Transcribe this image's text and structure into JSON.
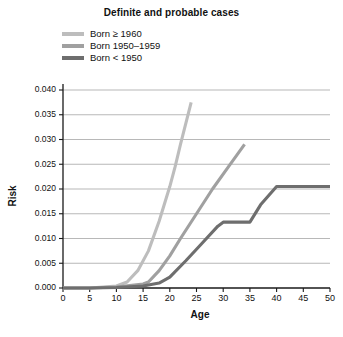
{
  "chart_data": {
    "type": "line",
    "title": "Definite and probable cases",
    "xlabel": "Age",
    "ylabel": "Risk",
    "xlim": [
      0,
      50
    ],
    "ylim": [
      0.0,
      0.04
    ],
    "xticks": [
      0,
      5,
      10,
      15,
      20,
      25,
      30,
      35,
      40,
      45,
      50
    ],
    "yticks": [
      0.0,
      0.005,
      0.01,
      0.015,
      0.02,
      0.025,
      0.03,
      0.035,
      0.04
    ],
    "ytick_labels": [
      "0.000",
      "0.005",
      "0.010",
      "0.015",
      "0.020",
      "0.025",
      "0.030",
      "0.035",
      "0.040"
    ],
    "xtick_labels": [
      "0",
      "5",
      "10",
      "15",
      "20",
      "25",
      "30",
      "35",
      "40",
      "45",
      "50"
    ],
    "grid": "horizontal",
    "legend_position": "above-plot-left",
    "series": [
      {
        "name": "Born ≥ 1960",
        "color": "#bdbdbd",
        "x": [
          0,
          5,
          10,
          12,
          14,
          16,
          18,
          20,
          21,
          22,
          24
        ],
        "y": [
          0.0,
          0.0,
          0.0004,
          0.0012,
          0.0035,
          0.0075,
          0.0135,
          0.0205,
          0.0245,
          0.029,
          0.0375
        ]
      },
      {
        "name": "Born 1950–1959",
        "color": "#a0a0a0",
        "x": [
          0,
          5,
          10,
          15,
          16,
          18,
          20,
          22,
          25,
          28,
          31,
          34
        ],
        "y": [
          0.0,
          0.0,
          0.0002,
          0.0008,
          0.0012,
          0.0035,
          0.0065,
          0.01,
          0.015,
          0.02,
          0.0245,
          0.029
        ]
      },
      {
        "name": "Born < 1950",
        "color": "#6e6e6e",
        "x": [
          0,
          5,
          10,
          15,
          18,
          20,
          23,
          26,
          29,
          30,
          35,
          37,
          40,
          45,
          50
        ],
        "y": [
          0.0,
          0.0,
          0.0001,
          0.0004,
          0.001,
          0.0022,
          0.0055,
          0.009,
          0.0125,
          0.0133,
          0.0133,
          0.0168,
          0.0205,
          0.0205,
          0.0205
        ]
      }
    ]
  },
  "legend": {
    "items": [
      {
        "label": "Born ≥ 1960",
        "color": "#bdbdbd"
      },
      {
        "label": "Born 1950–1959",
        "color": "#a0a0a0"
      },
      {
        "label": "Born < 1950",
        "color": "#6e6e6e"
      }
    ]
  }
}
